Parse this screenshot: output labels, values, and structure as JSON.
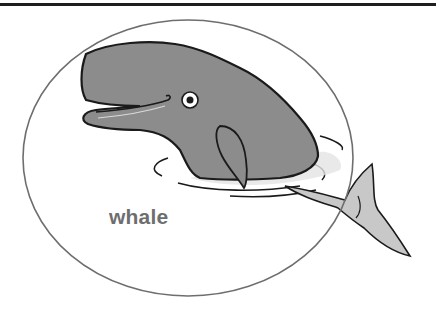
{
  "illustration": {
    "subject": "whale",
    "label": "whale",
    "colors": {
      "rule": "#1e1e1e",
      "ellipse_stroke": "#6e6e6e",
      "body_fill": "#8c8c8c",
      "tail_fill": "#c8c8c8",
      "outline": "#1a1a1a",
      "label": "#6e6e6e"
    }
  }
}
